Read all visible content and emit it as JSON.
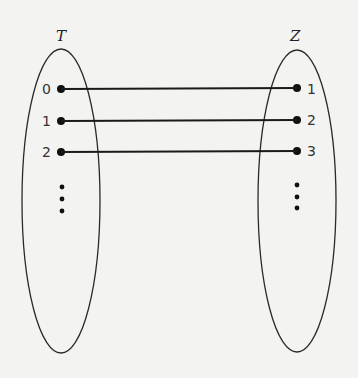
{
  "diagram": {
    "type": "mapping",
    "sets": [
      {
        "name": "T",
        "elements": [
          "0",
          "1",
          "2"
        ],
        "continues": true
      },
      {
        "name": "Z",
        "elements": [
          "1",
          "2",
          "3"
        ],
        "continues": true
      }
    ],
    "mappings": [
      {
        "from": "0",
        "to": "1"
      },
      {
        "from": "1",
        "to": "2"
      },
      {
        "from": "2",
        "to": "3"
      }
    ],
    "colors": {
      "ink": "#1a1a1a",
      "background": "#f3f3f1"
    }
  }
}
